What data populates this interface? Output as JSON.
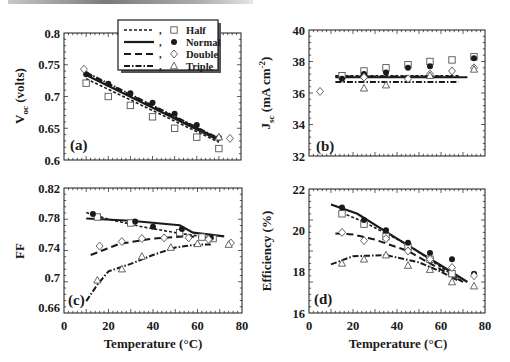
{
  "figure": {
    "x_axis_title": "Temperature (°C)",
    "legend": {
      "entries": [
        {
          "label": "Half",
          "line": "short-dash",
          "marker": "square"
        },
        {
          "label": "Normal",
          "line": "solid",
          "marker": "filled-circle"
        },
        {
          "label": "Double",
          "line": "long-dash",
          "marker": "diamond"
        },
        {
          "label": "Triple",
          "line": "dash-dot",
          "marker": "triangle"
        }
      ]
    },
    "colors": {
      "ink": "#1a1a1a",
      "marker_fill_open": "#ffffff",
      "marker_stroke": "#555555"
    }
  },
  "chart_data": [
    {
      "panel": "(a)",
      "type": "line",
      "ylabel": "V_oc (volts)",
      "ylabel_main": "V",
      "ylabel_sub": "oc",
      "ylabel_rest": " (volts)",
      "xlabel": "",
      "xlim": [
        0,
        80
      ],
      "ylim": [
        0.6,
        0.8
      ],
      "yticks": [
        "0.6",
        "0.65",
        "0.7",
        "0.75",
        "0.8"
      ],
      "xticks_labeled": false,
      "grid": false,
      "legend_position": "top-center",
      "series": [
        {
          "name": "Half",
          "points_x": [
            10,
            20,
            30,
            40,
            50,
            60,
            70
          ],
          "points_y": [
            0.721,
            0.7,
            0.686,
            0.668,
            0.65,
            0.636,
            0.618
          ],
          "fit_x": [
            10,
            70
          ],
          "fit_y": [
            0.728,
            0.628
          ]
        },
        {
          "name": "Normal",
          "points_x": [
            10,
            20,
            30,
            40,
            50,
            60,
            70
          ],
          "points_y": [
            0.735,
            0.72,
            0.705,
            0.69,
            0.673,
            0.655,
            0.635
          ],
          "fit_x": [
            10,
            70
          ],
          "fit_y": [
            0.734,
            0.631
          ]
        },
        {
          "name": "Double",
          "points_x": [
            9,
            75
          ],
          "points_y": [
            0.743,
            0.634
          ],
          "fit_x": [
            10,
            70
          ],
          "fit_y": [
            0.737,
            0.633
          ]
        },
        {
          "name": "Triple",
          "points_x": [
            70
          ],
          "points_y": [
            0.636
          ],
          "fit_x": [
            10,
            70
          ],
          "fit_y": [
            0.738,
            0.634
          ]
        }
      ]
    },
    {
      "panel": "(b)",
      "type": "line",
      "ylabel": "J_sc (mA cm^-2)",
      "ylabel_main": "J",
      "ylabel_sub": "sc",
      "ylabel_rest": " (mA cm",
      "ylabel_sup": "-2",
      "ylabel_end": ")",
      "xlabel": "",
      "xlim": [
        0,
        80
      ],
      "ylim": [
        32,
        40
      ],
      "yticks": [
        "32",
        "34",
        "36",
        "38",
        "40"
      ],
      "xticks_labeled": false,
      "grid": false,
      "series": [
        {
          "name": "Half",
          "points_x": [
            15,
            25,
            35,
            45,
            55,
            65,
            75
          ],
          "points_y": [
            37.1,
            37.4,
            37.6,
            37.8,
            38.0,
            38.1,
            38.3
          ],
          "fit_x": [
            12,
            68
          ],
          "fit_y": [
            37.1,
            37.1
          ]
        },
        {
          "name": "Normal",
          "points_x": [
            15,
            25,
            35,
            45,
            55,
            75
          ],
          "points_y": [
            36.9,
            37.2,
            37.3,
            37.6,
            37.7,
            38.2
          ],
          "fit_x": [
            12,
            72
          ],
          "fit_y": [
            37.0,
            37.0
          ]
        },
        {
          "name": "Double",
          "points_x": [
            5,
            25,
            45,
            55,
            65,
            75
          ],
          "points_y": [
            36.1,
            37.0,
            36.9,
            37.2,
            37.4,
            37.6
          ],
          "fit_x": [
            12,
            68
          ],
          "fit_y": [
            37.05,
            37.05
          ]
        },
        {
          "name": "Triple",
          "points_x": [
            25,
            35,
            55,
            75
          ],
          "points_y": [
            36.3,
            36.5,
            37.1,
            37.5
          ],
          "fit_x": [
            12,
            68
          ],
          "fit_y": [
            36.7,
            36.7
          ]
        }
      ]
    },
    {
      "panel": "(c)",
      "type": "line",
      "ylabel": "FF",
      "xlabel": "Temperature (°C)",
      "xlim": [
        0,
        80
      ],
      "ylim": [
        0.652,
        0.82
      ],
      "yticks": [
        "0.66",
        "0.7",
        "0.74",
        "0.78",
        "0.82"
      ],
      "ytick_values": [
        0.66,
        0.7,
        0.74,
        0.78,
        0.82
      ],
      "xticks": [
        "0",
        "20",
        "40",
        "60",
        "80"
      ],
      "grid": false,
      "series": [
        {
          "name": "Half",
          "points_x": [
            15,
            30,
            52,
            62,
            67
          ],
          "points_y": [
            0.781,
            0.773,
            0.76,
            0.754,
            0.752
          ],
          "fit_x": [
            10,
            20,
            35,
            50,
            68
          ],
          "fit_y": [
            0.787,
            0.778,
            0.768,
            0.76,
            0.752
          ]
        },
        {
          "name": "Normal",
          "points_x": [
            13,
            32,
            40,
            53,
            66
          ],
          "points_y": [
            0.785,
            0.775,
            0.768,
            0.765,
            0.753
          ],
          "fit_x": [
            10,
            30,
            52,
            58,
            72
          ],
          "fit_y": [
            0.779,
            0.776,
            0.77,
            0.76,
            0.755
          ]
        },
        {
          "name": "Double",
          "points_x": [
            16,
            26,
            35,
            45,
            56,
            65,
            75
          ],
          "points_y": [
            0.742,
            0.748,
            0.752,
            0.753,
            0.753,
            0.751,
            0.746
          ],
          "fit_x": [
            12,
            25,
            40,
            55,
            68
          ],
          "fit_y": [
            0.73,
            0.745,
            0.752,
            0.755,
            0.753
          ]
        },
        {
          "name": "Triple",
          "points_x": [
            15,
            26,
            35,
            48,
            60,
            74
          ],
          "points_y": [
            0.696,
            0.711,
            0.728,
            0.74,
            0.745,
            0.744
          ],
          "fit_x": [
            10,
            15,
            20,
            30,
            40,
            50,
            60,
            66
          ],
          "fit_y": [
            0.668,
            0.69,
            0.708,
            0.718,
            0.73,
            0.74,
            0.744,
            0.744
          ]
        }
      ]
    },
    {
      "panel": "(d)",
      "type": "line",
      "ylabel": "Efficiency (%)",
      "xlabel": "Temperature (°C)",
      "xlim": [
        0,
        80
      ],
      "ylim": [
        16,
        22
      ],
      "yticks": [
        "16",
        "18",
        "20",
        "22"
      ],
      "ytick_values": [
        16,
        18,
        20,
        22
      ],
      "xticks": [
        "0",
        "20",
        "40",
        "60",
        "80"
      ],
      "grid": false,
      "series": [
        {
          "name": "Half",
          "points_x": [
            15,
            25,
            35,
            45,
            55,
            65
          ],
          "points_y": [
            20.8,
            20.3,
            19.7,
            19.2,
            18.6,
            17.9
          ],
          "fit_x": [
            15,
            25,
            45,
            70
          ],
          "fit_y": [
            20.85,
            20.4,
            19.3,
            17.5
          ]
        },
        {
          "name": "Normal",
          "points_x": [
            15,
            25,
            35,
            45,
            55,
            65,
            75
          ],
          "points_y": [
            21.1,
            20.5,
            20.0,
            19.4,
            18.9,
            18.6,
            17.9
          ],
          "fit_x": [
            10,
            22,
            40,
            60,
            72
          ],
          "fit_y": [
            21.25,
            20.8,
            19.6,
            18.3,
            17.5
          ]
        },
        {
          "name": "Double",
          "points_x": [
            15,
            25,
            35,
            45,
            55,
            65,
            75
          ],
          "points_y": [
            19.9,
            19.5,
            19.6,
            19.0,
            18.6,
            18.2,
            17.8
          ],
          "fit_x": [
            12,
            20,
            30,
            45,
            60,
            70
          ],
          "fit_y": [
            19.85,
            19.8,
            19.55,
            19.0,
            18.1,
            17.5
          ]
        },
        {
          "name": "Triple",
          "points_x": [
            15,
            25,
            35,
            45,
            55,
            65,
            75
          ],
          "points_y": [
            18.4,
            18.6,
            18.8,
            18.3,
            18.1,
            17.5,
            17.3
          ],
          "fit_x": [
            10,
            20,
            35,
            50,
            60,
            68
          ],
          "fit_y": [
            18.35,
            18.75,
            18.8,
            18.45,
            18.0,
            17.55
          ]
        }
      ]
    }
  ]
}
